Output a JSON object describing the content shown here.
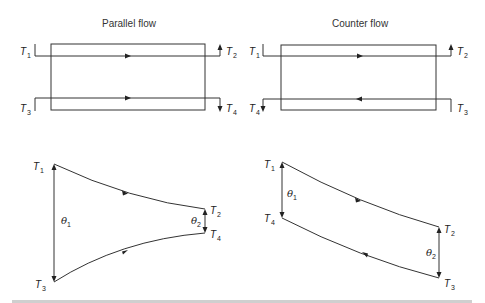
{
  "figure": {
    "panels": [
      {
        "title": "Parallel flow",
        "top_labels": {
          "hot_in": "T1",
          "hot_out": "T2",
          "cold_in": "T3",
          "cold_out": "T4"
        },
        "graph": {
          "curves": [
            {
              "from": "T1",
              "to": "T2",
              "direction": "left-to-right",
              "shape": "decreasing"
            },
            {
              "from": "T3",
              "to": "T4",
              "direction": "left-to-right",
              "shape": "increasing"
            }
          ],
          "theta_left": "θ1",
          "theta_right": "θ2",
          "point_labels": [
            "T1",
            "T2",
            "T3",
            "T4"
          ]
        }
      },
      {
        "title": "Counter flow",
        "top_labels": {
          "hot_in": "T1",
          "hot_out": "T2",
          "cold_in": "T3",
          "cold_out": "T4"
        },
        "graph": {
          "curves": [
            {
              "from": "T1",
              "to": "T2",
              "direction": "left-to-right",
              "shape": "decreasing"
            },
            {
              "from": "T3",
              "to": "T4",
              "direction": "right-to-left",
              "shape": "increasing"
            }
          ],
          "theta_left": "θ1",
          "theta_right": "θ2",
          "point_labels": [
            "T1",
            "T2",
            "T4",
            "T3"
          ]
        }
      }
    ]
  },
  "text": {
    "parallel_title": "Parallel flow",
    "counter_title": "Counter flow",
    "T": "T",
    "s1": "1",
    "s2": "2",
    "s3": "3",
    "s4": "4",
    "theta": "θ"
  }
}
